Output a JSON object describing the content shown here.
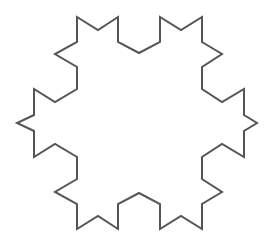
{
  "figure": {
    "type": "koch-snowflake-outline",
    "stroke_color": "#555555",
    "fill_color": "#ffffff",
    "background": "#ffffff",
    "stroke_width": 2
  }
}
